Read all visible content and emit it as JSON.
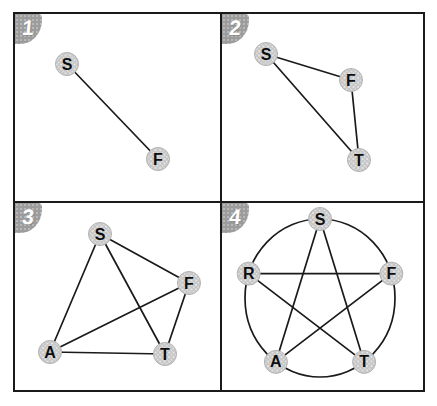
{
  "colors": {
    "background": "#ffffff",
    "border": "#1a1a1a",
    "edge": "#1a1a1a",
    "node_fill": "#c6c6c6",
    "node_speckle": "#ebebeb",
    "node_stroke": "#b2b2b2",
    "label": "#0d0d0d",
    "badge_bg": "#9c9c9c",
    "badge_text": "#ffffff"
  },
  "panels": [
    {
      "label": "1",
      "nodes": [
        {
          "id": "S",
          "x": 52,
          "y": 50
        },
        {
          "id": "F",
          "x": 143,
          "y": 145
        }
      ],
      "edges": [
        [
          "S",
          "F"
        ]
      ]
    },
    {
      "label": "2",
      "nodes": [
        {
          "id": "S",
          "x": 44,
          "y": 40
        },
        {
          "id": "F",
          "x": 129,
          "y": 66
        },
        {
          "id": "T",
          "x": 137,
          "y": 146
        }
      ],
      "edges": [
        [
          "S",
          "F"
        ],
        [
          "S",
          "T"
        ],
        [
          "F",
          "T"
        ]
      ]
    },
    {
      "label": "3",
      "nodes": [
        {
          "id": "S",
          "x": 85,
          "y": 31
        },
        {
          "id": "F",
          "x": 174,
          "y": 80
        },
        {
          "id": "A",
          "x": 35,
          "y": 149
        },
        {
          "id": "T",
          "x": 150,
          "y": 151
        }
      ],
      "edges": [
        [
          "S",
          "F"
        ],
        [
          "S",
          "A"
        ],
        [
          "S",
          "T"
        ],
        [
          "A",
          "F"
        ],
        [
          "A",
          "T"
        ],
        [
          "F",
          "T"
        ]
      ]
    },
    {
      "label": "4",
      "circle": {
        "cx": 98,
        "cy": 95,
        "rx": 75,
        "ry": 79
      },
      "nodes": [
        {
          "id": "S",
          "x": 98,
          "y": 16
        },
        {
          "id": "R",
          "x": 26.7,
          "y": 70.6
        },
        {
          "id": "F",
          "x": 169.3,
          "y": 70.6
        },
        {
          "id": "A",
          "x": 53.9,
          "y": 158.9
        },
        {
          "id": "T",
          "x": 142.1,
          "y": 158.9
        }
      ],
      "edges": [
        [
          "S",
          "A"
        ],
        [
          "S",
          "T"
        ],
        [
          "R",
          "F"
        ],
        [
          "R",
          "T"
        ],
        [
          "A",
          "F"
        ]
      ]
    }
  ]
}
